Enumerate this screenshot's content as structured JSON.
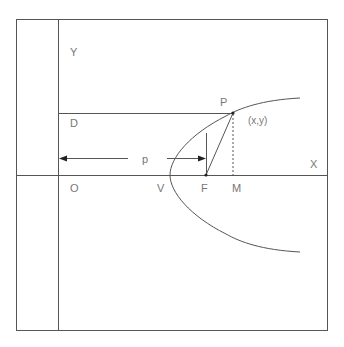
{
  "diagram": {
    "type": "parabola-geometry",
    "colors": {
      "line": "#555555",
      "label": "#777777",
      "background": "#ffffff"
    },
    "labels": {
      "y_axis": "Y",
      "x_axis": "X",
      "origin": "O",
      "directrix_point": "D",
      "distance": "p",
      "vertex": "V",
      "focus": "F",
      "foot": "M",
      "point": "P",
      "point_coords": "(x,y)"
    }
  }
}
